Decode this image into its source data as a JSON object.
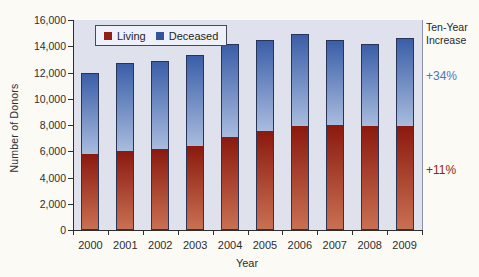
{
  "chart_data": {
    "type": "bar",
    "stacked": true,
    "title": "",
    "categories": [
      "2000",
      "2001",
      "2002",
      "2003",
      "2004",
      "2005",
      "2006",
      "2007",
      "2008",
      "2009"
    ],
    "series": [
      {
        "name": "Living",
        "position": "bottom",
        "swatch_color": "#8e2015",
        "gradient_top": "#8a190e",
        "gradient_bottom": "#c97052",
        "values": [
          5900,
          6100,
          6250,
          6450,
          7150,
          7600,
          8000,
          8100,
          8000,
          8000
        ]
      },
      {
        "name": "Deceased",
        "position": "top",
        "swatch_color": "#31549b",
        "gradient_top": "#3a5ea8",
        "gradient_bottom": "#a9bcde",
        "values": [
          6050,
          6600,
          6650,
          6900,
          7000,
          6900,
          6900,
          6400,
          6200,
          6650
        ]
      }
    ],
    "xlabel": "Year",
    "ylabel": "Number of Donors",
    "ylim": [
      0,
      16000
    ],
    "yticks": {
      "values": [
        0,
        2000,
        4000,
        6000,
        8000,
        10000,
        12000,
        14000,
        16000
      ],
      "labels": [
        "0",
        "2,000",
        "4,000",
        "6,000",
        "8,000",
        "10,000",
        "12,000",
        "14,000",
        "16,000"
      ]
    },
    "grid": false,
    "legend_position": "top-inside",
    "plot_bg": "#dfe2ed",
    "annotations": {
      "title_line1": "Ten-Year",
      "title_line2": "Increase",
      "deceased_pct": {
        "text": "+34%",
        "color": "#4a78bb"
      },
      "living_pct": {
        "text": "+11%",
        "color": "#8e2518"
      }
    }
  }
}
